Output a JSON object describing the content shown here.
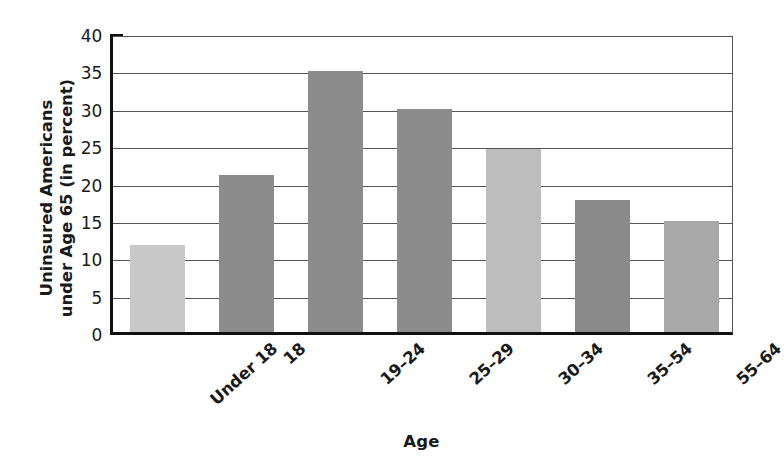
{
  "chart_data": {
    "type": "bar",
    "title": "",
    "xlabel": "Age",
    "ylabel": "Uninsured Americans under Age 65 (in percent)",
    "ylabel_lines": [
      "Uninsured Americans",
      "under Age 65 (in percent)"
    ],
    "categories": [
      "Under 18",
      "18",
      "19–24",
      "25–29",
      "30–34",
      "35–54",
      "55–64"
    ],
    "values": [
      11.7,
      21.0,
      34.9,
      29.8,
      24.5,
      17.7,
      14.9
    ],
    "bar_colors": [
      "#c8c8c8",
      "#8c8c8c",
      "#8c8c8c",
      "#8c8c8c",
      "#bdbdbd",
      "#8a8a8a",
      "#a8a8a8"
    ],
    "ylim": [
      0,
      40
    ],
    "ytick_values": [
      0,
      5,
      10,
      15,
      20,
      25,
      30,
      35,
      40
    ],
    "ytick_labels": [
      "0",
      "5",
      "10",
      "15",
      "20",
      "25",
      "30",
      "35",
      "40"
    ],
    "grid": true,
    "grid_axis": "y",
    "legend": "none",
    "legend_position": "none",
    "axis_line_color": "#111111",
    "grid_color": "#555555",
    "background": "#ffffff"
  }
}
